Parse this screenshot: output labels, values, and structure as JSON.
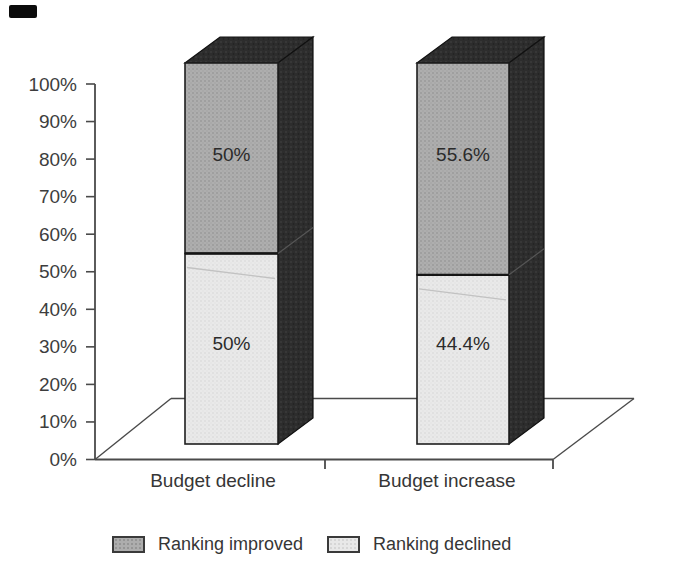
{
  "chart_data": {
    "type": "bar",
    "variant": "3d-stacked-percent",
    "title": "",
    "categories": [
      "Budget decline",
      "Budget increase"
    ],
    "series": [
      {
        "name": "Ranking improved",
        "position": "top",
        "values": [
          50,
          55.6
        ],
        "labels": [
          "50%",
          "55.6%"
        ],
        "color": "#a9a9a9"
      },
      {
        "name": "Ranking declined",
        "position": "bottom",
        "values": [
          50,
          44.4
        ],
        "labels": [
          "50%",
          "44.4%"
        ],
        "color": "#e6e6e6"
      },
      {
        "name": "_3d-side-faces",
        "color": "#2e2e2e"
      }
    ],
    "xlabel": "",
    "ylabel": "",
    "ylim": [
      0,
      100
    ],
    "yticks": [
      "0%",
      "10%",
      "20%",
      "30%",
      "40%",
      "50%",
      "60%",
      "70%",
      "80%",
      "90%",
      "100%"
    ],
    "grid": false,
    "legend_position": "bottom",
    "colors": {
      "outline": "#1f1f1f",
      "axis": "#4a4a4a",
      "text": "#363636"
    }
  }
}
